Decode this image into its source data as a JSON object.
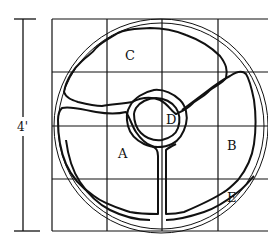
{
  "diagram": {
    "dimension_label": "4'",
    "region_labels": {
      "A": "A",
      "B": "B",
      "C": "C",
      "D": "D",
      "E": "E"
    },
    "grid": {
      "columns": 4,
      "rows": 4
    },
    "colors": {
      "ink": "#111111",
      "background": "#ffffff"
    }
  }
}
